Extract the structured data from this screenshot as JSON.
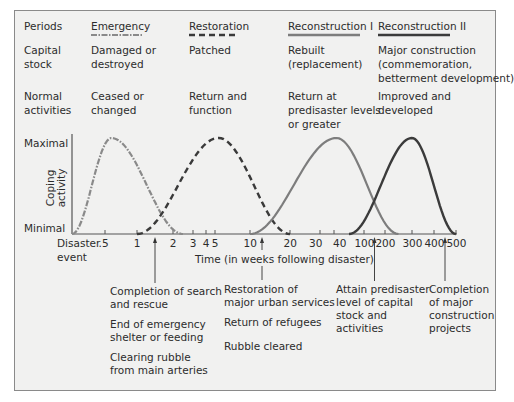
{
  "header": {
    "periods_label": "Periods",
    "capital_stock_label": "Capital stock",
    "capital_stock_lines": [
      "Capital",
      "stock"
    ],
    "normal_activities_lines": [
      "Normal",
      "activities"
    ]
  },
  "periods": [
    {
      "name": "Emergency",
      "line_style": "dash-dot",
      "color": "#8a8a8a",
      "capital_stock": [
        "Damaged or",
        "destroyed"
      ],
      "normal_activities": [
        "Ceased or",
        "changed"
      ]
    },
    {
      "name": "Restoration",
      "line_style": "dashed",
      "color": "#3a3a3a",
      "capital_stock": [
        "Patched"
      ],
      "normal_activities": [
        "Return and",
        "function"
      ]
    },
    {
      "name": "Reconstruction I",
      "line_style": "solid",
      "color": "#7d7d7d",
      "capital_stock": [
        "Rebuilt",
        "(replacement)"
      ],
      "normal_activities": [
        "Return at",
        "predisaster levels",
        "or greater"
      ]
    },
    {
      "name": "Reconstruction II",
      "line_style": "solid",
      "color": "#3b3b3b",
      "capital_stock": [
        "Major construction",
        "(commemoration,",
        "betterment development)"
      ],
      "normal_activities": [
        "Improved and",
        "developed"
      ]
    }
  ],
  "axes": {
    "y_max_label": "Maximal",
    "y_min_label": "Minimal",
    "y_title_lines": [
      "Coping",
      "activity"
    ],
    "x_origin_lines": [
      "Disaster",
      "event"
    ],
    "x_title": "Time (in weeks following disaster)",
    "x_ticks": [
      ".5",
      "1",
      "2",
      "3",
      "4",
      "5",
      "10",
      "20",
      "30",
      "40",
      "100",
      "200",
      "300",
      "400",
      "500"
    ]
  },
  "milestones": [
    {
      "at_weeks": 1.5,
      "lines": [
        [
          "Completion of search",
          "and rescue"
        ],
        [
          "End of emergency",
          "shelter or feeding"
        ],
        [
          "Clearing rubble",
          "from main arteries"
        ]
      ]
    },
    {
      "at_weeks": 13,
      "lines": [
        [
          "Restoration of",
          "major urban services"
        ],
        [
          "Return of refugees"
        ],
        [
          "Rubble cleared"
        ]
      ]
    },
    {
      "at_weeks": 150,
      "lines": [
        [
          "Attain predisaster",
          "level of capital",
          "stock and",
          "activities"
        ]
      ]
    },
    {
      "at_weeks": 450,
      "lines": [
        [
          "Completion",
          "of major",
          "construction",
          "projects"
        ]
      ]
    }
  ],
  "chart_data": {
    "type": "line",
    "title": "",
    "xlabel": "Time (in weeks following disaster)",
    "ylabel": "Coping activity",
    "x_scale": "log-like (schematic)",
    "y_range_labels": [
      "Minimal",
      "Maximal"
    ],
    "series": [
      {
        "name": "Emergency",
        "start_weeks": 0,
        "peak_weeks": 0.6,
        "end_weeks": 2.5,
        "peak_level": 1.0
      },
      {
        "name": "Restoration",
        "start_weeks": 1,
        "peak_weeks": 5.5,
        "end_weeks": 20,
        "peak_level": 1.0
      },
      {
        "name": "Reconstruction I",
        "start_weeks": 10,
        "peak_weeks": 45,
        "end_weeks": 250,
        "peak_level": 1.0
      },
      {
        "name": "Reconstruction II",
        "start_weeks": 70,
        "peak_weeks": 300,
        "end_weeks": 500,
        "peak_level": 1.0
      }
    ]
  }
}
